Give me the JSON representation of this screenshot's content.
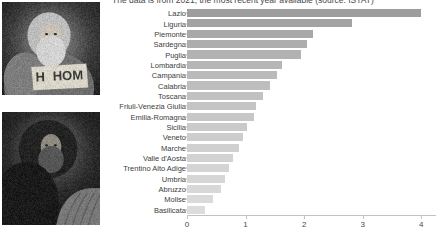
{
  "caption": {
    "text": "The data is from 2021, the most recent year available (source: ISTAT)"
  },
  "photos": [
    {
      "name": "photo-bearded-man-with-sign",
      "alt": "Black and white photo of a bearded long-haired man seated holding a cardboard sign reading HOM"
    },
    {
      "name": "photo-hooded-bearded-figure",
      "alt": "Dark black and white photo of a hooded bearded figure"
    }
  ],
  "chart_data": {
    "type": "bar",
    "orientation": "horizontal",
    "title": "",
    "subtitle": "The data is from 2021, the most recent year available (source: ISTAT)",
    "xlabel": "",
    "ylabel": "",
    "xlim": [
      0,
      4.25
    ],
    "xticks": [
      0,
      1,
      2,
      3,
      4
    ],
    "xticklabels": [
      "0",
      "1",
      "2",
      "3",
      "4"
    ],
    "grid": false,
    "legend": false,
    "categories": [
      "Lazio",
      "Liguria",
      "Piemonte",
      "Sardegna",
      "Puglia",
      "Lombardia",
      "Campania",
      "Calabria",
      "Toscana",
      "Friuli-Venezia Giulia",
      "Emilia-Romagna",
      "Sicilia",
      "Veneto",
      "Marche",
      "Valle d'Aosta",
      "Trentino Alto Adige",
      "Umbria",
      "Abruzzo",
      "Molise",
      "Basilicata"
    ],
    "values": [
      4.0,
      2.82,
      2.15,
      2.04,
      1.95,
      1.63,
      1.54,
      1.42,
      1.29,
      1.18,
      1.14,
      1.03,
      0.95,
      0.88,
      0.78,
      0.71,
      0.65,
      0.58,
      0.44,
      0.3
    ],
    "bar_colors": [
      "#9d9d9d",
      "#a3a3a3",
      "#a8a8a8",
      "#adadad",
      "#b2b2b2",
      "#b6b6b6",
      "#bababa",
      "#bebebe",
      "#c1c1c1",
      "#c4c4c4",
      "#c7c7c7",
      "#cacaca",
      "#cdcdcd",
      "#d0d0d0",
      "#d2d2d2",
      "#d4d4d4",
      "#d6d6d6",
      "#d8d8d8",
      "#dadada",
      "#dcdcdc"
    ]
  }
}
